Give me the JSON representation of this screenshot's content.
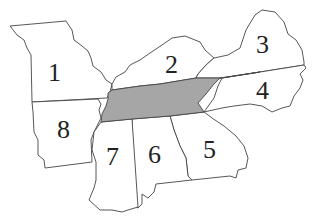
{
  "map": {
    "highlight_color": "#a6a6a6",
    "highlighted_region": "center",
    "regions": [
      {
        "id": "1",
        "label": "1"
      },
      {
        "id": "2",
        "label": "2"
      },
      {
        "id": "3",
        "label": "3"
      },
      {
        "id": "4",
        "label": "4"
      },
      {
        "id": "5",
        "label": "5"
      },
      {
        "id": "6",
        "label": "6"
      },
      {
        "id": "7",
        "label": "7"
      },
      {
        "id": "8",
        "label": "8"
      }
    ]
  }
}
